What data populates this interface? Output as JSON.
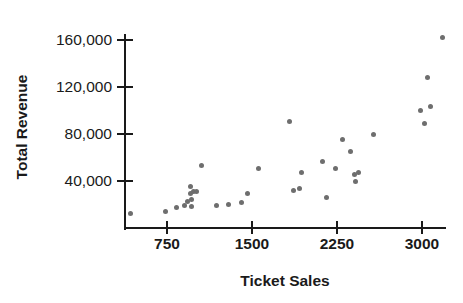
{
  "chart": {
    "title": "",
    "xlabel": "Ticket Sales",
    "ylabel": "Total Revenue"
  },
  "axes": {
    "y_ticks": [
      {
        "label": "40,000",
        "value": 40000
      },
      {
        "label": "80,000",
        "value": 80000
      },
      {
        "label": "120,000",
        "value": 120000
      },
      {
        "label": "160,000",
        "value": 160000
      }
    ],
    "x_ticks": [
      {
        "label": "750",
        "value": 750
      },
      {
        "label": "1500",
        "value": 1500
      },
      {
        "label": "2250",
        "value": 2250
      },
      {
        "label": "3000",
        "value": 3000
      }
    ]
  },
  "style": {
    "point_color": "#6e6e6e",
    "axis_color": "#1a1a1a",
    "background": "#ffffff"
  },
  "chart_data": {
    "type": "scatter",
    "title": "",
    "xlabel": "Ticket Sales",
    "ylabel": "Total Revenue",
    "xlim": [
      400,
      3250
    ],
    "ylim": [
      0,
      175000
    ],
    "grid": false,
    "legend": null,
    "marker": "circle",
    "series": [
      {
        "name": "Concerts",
        "points": [
          [
            432,
            12700
          ],
          [
            741,
            14400
          ],
          [
            838,
            17800
          ],
          [
            900,
            19500
          ],
          [
            935,
            22800
          ],
          [
            953,
            29700
          ],
          [
            956,
            35000
          ],
          [
            962,
            24400
          ],
          [
            970,
            18600
          ],
          [
            988,
            31200
          ],
          [
            1006,
            31000
          ],
          [
            1050,
            53500
          ],
          [
            1191,
            19500
          ],
          [
            1297,
            19900
          ],
          [
            1403,
            21600
          ],
          [
            1462,
            29700
          ],
          [
            1553,
            50800
          ],
          [
            1835,
            91000
          ],
          [
            1862,
            31500
          ],
          [
            1915,
            33700
          ],
          [
            1941,
            47200
          ],
          [
            2118,
            56500
          ],
          [
            2153,
            25800
          ],
          [
            2241,
            51000
          ],
          [
            2295,
            75000
          ],
          [
            2365,
            65000
          ],
          [
            2400,
            45800
          ],
          [
            2409,
            39600
          ],
          [
            2444,
            47000
          ],
          [
            2568,
            79500
          ],
          [
            2988,
            99800
          ],
          [
            3024,
            89000
          ],
          [
            3047,
            128000
          ],
          [
            3071,
            103500
          ],
          [
            3180,
            162500
          ]
        ]
      }
    ]
  }
}
